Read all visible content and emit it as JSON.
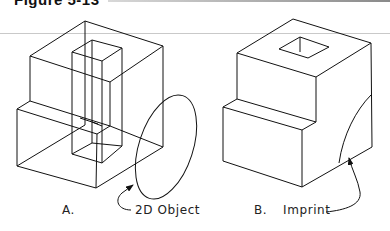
{
  "header": {
    "title": "Figure 5-13"
  },
  "figures": [
    {
      "id": "A",
      "letter": "A.",
      "caption": "2D Object",
      "description": "Wireframe stepped solid with rectangular pillar and 2D ellipse placed on the right face"
    },
    {
      "id": "B",
      "letter": "B.",
      "caption": "Imprint",
      "description": "Shaded-edge stepped solid with square hole on top and imprinted arc on right face"
    }
  ],
  "colors": {
    "line": "#111111",
    "background": "#ffffff",
    "rule": "#c9c9c9"
  }
}
